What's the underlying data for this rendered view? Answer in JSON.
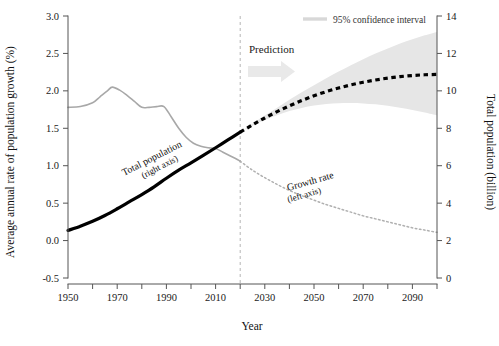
{
  "chart_data": {
    "type": "line",
    "title": "",
    "xlabel": "Year",
    "ylabel": "Average annual rate of population growth (%)",
    "y2label": "Total population (billion)",
    "xlim": [
      1950,
      2100
    ],
    "ylim": [
      -0.5,
      3.0
    ],
    "y2lim": [
      0,
      14
    ],
    "grid": false,
    "x_ticks_major": [
      1950,
      1970,
      1990,
      2010,
      2030,
      2050,
      2070,
      2090
    ],
    "x_ticks_minor": [
      1960,
      1980,
      2000,
      2020,
      2040,
      2060,
      2080,
      2100
    ],
    "x_tick_labels": [
      "1950",
      "1970",
      "1990",
      "2010",
      "2030",
      "2050",
      "2070",
      "2090"
    ],
    "y_ticks": [
      -0.5,
      0.0,
      0.5,
      1.0,
      1.5,
      2.0,
      2.5,
      3.0
    ],
    "y_tick_labels": [
      "-0.5",
      "0.0",
      "0.5",
      "1.0",
      "1.5",
      "2.0",
      "2.5",
      "3.0"
    ],
    "y2_ticks": [
      0,
      2,
      4,
      6,
      8,
      10,
      12,
      14
    ],
    "y2_tick_labels": [
      "0",
      "2",
      "4",
      "6",
      "8",
      "10",
      "12",
      "14"
    ],
    "prediction_start_year": 2020,
    "legend": {
      "position": "top-right",
      "entries": [
        {
          "label": "95% confidence interval",
          "color": "#d8d8d8",
          "style": "band"
        }
      ]
    },
    "annotations": [
      {
        "text": "Prediction",
        "x": 2025,
        "y": 2.62,
        "style": "bold-serif"
      },
      {
        "text": "Total population",
        "line2": "(right axis)",
        "x": 1988,
        "y": 0.92,
        "rotation": -26
      },
      {
        "text": "Growth rate",
        "line2": "(left axis)",
        "x": 2048,
        "y": 0.88,
        "rotation": -15
      }
    ],
    "series": [
      {
        "name": "Growth rate (historical)",
        "axis": "left",
        "style": "solid-gray",
        "color": "#a8a8a8",
        "x": [
          1950,
          1955,
          1960,
          1963,
          1966,
          1968,
          1971,
          1974,
          1977,
          1980,
          1983,
          1986,
          1989,
          1992,
          1995,
          1998,
          2001,
          2004,
          2007,
          2010,
          2013,
          2016,
          2019,
          2020
        ],
        "values": [
          1.78,
          1.79,
          1.84,
          1.92,
          2.0,
          2.05,
          2.01,
          1.94,
          1.86,
          1.78,
          1.78,
          1.79,
          1.79,
          1.65,
          1.5,
          1.38,
          1.3,
          1.26,
          1.24,
          1.23,
          1.18,
          1.13,
          1.08,
          1.06
        ]
      },
      {
        "name": "Growth rate (projected)",
        "axis": "left",
        "style": "dotted-gray",
        "color": "#b0b0b0",
        "x": [
          2020,
          2025,
          2030,
          2035,
          2040,
          2045,
          2050,
          2055,
          2060,
          2065,
          2070,
          2075,
          2080,
          2085,
          2090,
          2095,
          2100
        ],
        "values": [
          1.06,
          0.94,
          0.84,
          0.75,
          0.67,
          0.6,
          0.54,
          0.48,
          0.43,
          0.38,
          0.33,
          0.29,
          0.25,
          0.21,
          0.17,
          0.14,
          0.11
        ]
      },
      {
        "name": "Total population (historical)",
        "axis": "right",
        "style": "solid-black-thick",
        "color": "#000000",
        "x": [
          1950,
          1955,
          1960,
          1965,
          1970,
          1975,
          1980,
          1985,
          1990,
          1995,
          2000,
          2005,
          2010,
          2015,
          2020
        ],
        "values": [
          2.54,
          2.77,
          3.03,
          3.34,
          3.7,
          4.08,
          4.46,
          4.87,
          5.33,
          5.76,
          6.15,
          6.55,
          6.96,
          7.38,
          7.79
        ]
      },
      {
        "name": "Total population (projected)",
        "axis": "right",
        "style": "dashed-black-thick",
        "color": "#000000",
        "x": [
          2020,
          2025,
          2030,
          2035,
          2040,
          2045,
          2050,
          2055,
          2060,
          2065,
          2070,
          2075,
          2080,
          2085,
          2090,
          2095,
          2100
        ],
        "values": [
          7.79,
          8.18,
          8.55,
          8.89,
          9.2,
          9.48,
          9.74,
          9.96,
          10.15,
          10.32,
          10.46,
          10.58,
          10.68,
          10.76,
          10.82,
          10.86,
          10.88
        ]
      }
    ],
    "confidence_interval": {
      "label": "95% confidence interval",
      "axis": "right",
      "color": "#e6e6e6",
      "x": [
        2020,
        2025,
        2030,
        2035,
        2040,
        2045,
        2050,
        2055,
        2060,
        2065,
        2070,
        2075,
        2080,
        2085,
        2090,
        2095,
        2100
      ],
      "lower": [
        7.79,
        8.13,
        8.44,
        8.7,
        8.92,
        9.09,
        9.22,
        9.3,
        9.34,
        9.35,
        9.33,
        9.28,
        9.2,
        9.1,
        8.98,
        8.85,
        8.7
      ],
      "upper": [
        7.79,
        8.24,
        8.68,
        9.1,
        9.52,
        9.92,
        10.3,
        10.68,
        11.03,
        11.37,
        11.69,
        11.99,
        12.27,
        12.53,
        12.76,
        12.97,
        13.15
      ]
    }
  }
}
